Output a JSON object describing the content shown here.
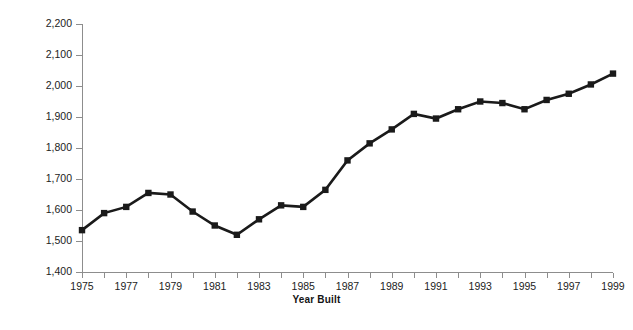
{
  "chart_data": {
    "type": "line",
    "title": "",
    "xlabel": "Year Built",
    "ylabel": "Square Feet",
    "xlim": [
      1975,
      1999
    ],
    "ylim": [
      1400,
      2200
    ],
    "ytick_step": 100,
    "xtick_step": 1,
    "xtick_label_step": 2,
    "grid": false,
    "legend": null,
    "marker": "square",
    "line_color": "#1a1a1a",
    "marker_color": "#1a1a1a",
    "axis_color": "#8d8d8d",
    "x": [
      1975,
      1976,
      1977,
      1978,
      1979,
      1980,
      1981,
      1982,
      1983,
      1984,
      1985,
      1986,
      1987,
      1988,
      1989,
      1990,
      1991,
      1992,
      1993,
      1994,
      1995,
      1996,
      1997,
      1998,
      1999
    ],
    "values": [
      1535,
      1590,
      1610,
      1655,
      1650,
      1595,
      1550,
      1520,
      1570,
      1615,
      1610,
      1665,
      1760,
      1815,
      1860,
      1910,
      1895,
      1925,
      1950,
      1945,
      1925,
      1955,
      1975,
      2005,
      2040
    ],
    "ytick_labels": [
      "1,400",
      "1,500",
      "1,600",
      "1,700",
      "1,800",
      "1,900",
      "2,000",
      "2,100",
      "2,200"
    ],
    "ytick_values": [
      1400,
      1500,
      1600,
      1700,
      1800,
      1900,
      2000,
      2100,
      2200
    ],
    "xtick_labels": [
      "1975",
      "1977",
      "1979",
      "1981",
      "1983",
      "1985",
      "1987",
      "1989",
      "1991",
      "1993",
      "1995",
      "1997",
      "1999"
    ],
    "xtick_values": [
      1975,
      1977,
      1979,
      1981,
      1983,
      1985,
      1987,
      1989,
      1991,
      1993,
      1995,
      1997,
      1999
    ]
  }
}
